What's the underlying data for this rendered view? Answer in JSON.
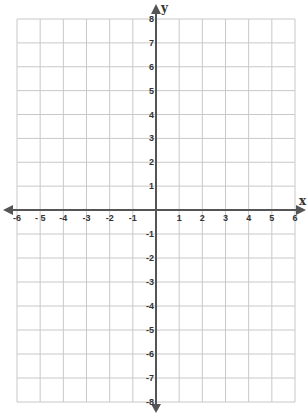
{
  "chart_data": {
    "type": "scatter",
    "title": "",
    "xlabel": "x",
    "ylabel": "y",
    "xlim": [
      -6,
      6
    ],
    "ylim": [
      -8,
      8
    ],
    "grid": true,
    "x_ticks": [
      "-6",
      "- 5",
      "-4",
      "-3",
      "-2",
      "-1",
      "1",
      "2",
      "3",
      "4",
      "5",
      "6"
    ],
    "y_ticks": [
      "8",
      "7",
      "6",
      "5",
      "4",
      "3",
      "2",
      "1",
      "-1",
      "-2",
      "-3",
      "-4",
      "-5",
      "-6",
      "-7",
      "-8"
    ],
    "series": [],
    "colors": {
      "grid": "#c8c8c8",
      "axis": "#555555",
      "text": "#333333"
    }
  }
}
